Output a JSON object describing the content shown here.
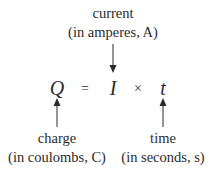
{
  "top_label": {
    "name": "current",
    "unit": "(in amperes, A)"
  },
  "equation": {
    "lhs": "Q",
    "equals": "=",
    "term1": "I",
    "operator": "×",
    "term2": "t"
  },
  "bottom_left_label": {
    "name": "charge",
    "unit": "(in coulombs, C)"
  },
  "bottom_right_label": {
    "name": "time",
    "unit": "(in seconds, s)"
  },
  "colors": {
    "text": "#2a2a2a",
    "arrow": "#2a2a2a",
    "background": "#ffffff"
  }
}
